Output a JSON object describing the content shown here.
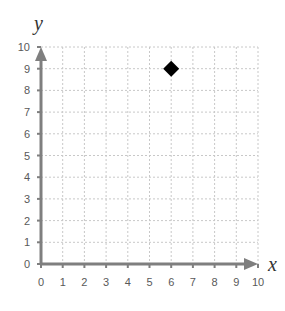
{
  "chart_data": {
    "type": "scatter",
    "title": "",
    "xlabel": "x",
    "ylabel": "y",
    "xlim": [
      0,
      10
    ],
    "ylim": [
      0,
      10
    ],
    "grid": true,
    "x_ticks": [
      "0",
      "1",
      "2",
      "3",
      "4",
      "5",
      "6",
      "7",
      "8",
      "9",
      "10"
    ],
    "y_ticks": [
      "0",
      "1",
      "2",
      "3",
      "4",
      "5",
      "6",
      "7",
      "8",
      "9",
      "10"
    ],
    "series": [
      {
        "name": "point",
        "marker": "diamond",
        "color": "#000000",
        "points": [
          {
            "x": 6,
            "y": 9
          }
        ]
      }
    ]
  },
  "colors": {
    "axis": "#7f7f7f",
    "grid": "#c8c8c8",
    "marker": "#000000"
  }
}
